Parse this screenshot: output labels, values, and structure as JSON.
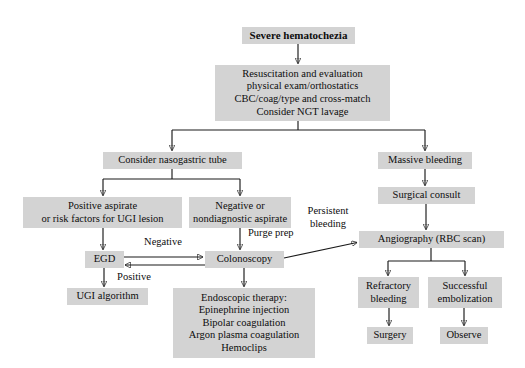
{
  "diagram": {
    "colors": {
      "box_fill": "#d3d3d3",
      "line": "#1a1a1a",
      "text": "#0d0d0d",
      "background": "#ffffff"
    },
    "nodes": {
      "severe_hematochezia": "Severe hematochezia",
      "resuscitation": "Resuscitation and evaluation\nphysical exam/orthostatics\nCBC/coag/type and cross-match\nConsider NGT lavage",
      "consider_ng_tube": "Consider nasogastric tube",
      "massive_bleeding": "Massive bleeding",
      "positive_aspirate": "Positive aspirate\nor risk factors for UGI lesion",
      "negative_aspirate": "Negative or\nnondiagnostic aspirate",
      "surgical_consult": "Surgical consult",
      "egd": "EGD",
      "colonoscopy": "Colonoscopy",
      "angiography": "Angiography (RBC scan)",
      "ugi_algorithm": "UGI algorithm",
      "endoscopic_therapy": "Endoscopic therapy:\nEpinephrine injection\nBipolar coagulation\nArgon plasma coagulation\nHemoclips",
      "refractory_bleeding": "Refractory\nbleeding",
      "successful_embolization": "Successful\nembolization",
      "surgery": "Surgery",
      "observe": "Observe"
    },
    "edge_labels": {
      "negative": "Negative",
      "positive": "Positive",
      "purge_prep": "Purge prep",
      "persistent_bleeding": "Persistent\nbleeding"
    }
  }
}
